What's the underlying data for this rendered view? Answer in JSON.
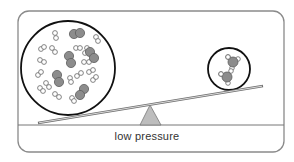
{
  "diagram": {
    "label": "low pressure",
    "colors": {
      "frame": "#8a8a8a",
      "ground": "#777777",
      "beam": "#6f6f6f",
      "fulcrum_fill": "#bdbdbd",
      "fulcrum_stroke": "#777777",
      "container_stroke": "#111111",
      "heavy_atom": "#8c8c8c",
      "light_atom": "#ffffff",
      "atom_stroke": "#666666"
    },
    "frame": {
      "x": 18,
      "y": 11,
      "w": 266,
      "h": 141,
      "r": 11
    },
    "ground": {
      "y": 125
    },
    "beam": {
      "x1": 38,
      "y1": 123,
      "x2": 263,
      "y2": 86
    },
    "fulcrum": {
      "apex": [
        150,
        105
      ],
      "left": [
        140,
        125
      ],
      "right": [
        161,
        125
      ]
    },
    "left_container": {
      "cx": 68,
      "cy": 68,
      "r": 47,
      "description": "many molecules: H2-like pairs of small white atoms and diatomic gray molecules",
      "gray_diatomics": [
        [
          [
            74,
            34
          ],
          [
            80,
            33
          ]
        ],
        [
          [
            69,
            56
          ],
          [
            71,
            63
          ]
        ],
        [
          [
            90,
            52
          ],
          [
            94,
            58
          ]
        ],
        [
          [
            57,
            75
          ],
          [
            59,
            82
          ]
        ],
        [
          [
            84,
            89
          ],
          [
            80,
            95
          ]
        ]
      ],
      "white_pairs": [
        [
          [
            55,
            33
          ],
          [
            56,
            38
          ]
        ],
        [
          [
            96,
            37
          ],
          [
            98,
            41
          ]
        ],
        [
          [
            41,
            49
          ],
          [
            44,
            47
          ]
        ],
        [
          [
            52,
            48
          ],
          [
            55,
            52
          ]
        ],
        [
          [
            76,
            48
          ],
          [
            80,
            48
          ]
        ],
        [
          [
            87,
            48
          ],
          [
            85,
            53
          ]
        ],
        [
          [
            40,
            60
          ],
          [
            44,
            62
          ]
        ],
        [
          [
            84,
            62
          ],
          [
            89,
            62
          ]
        ],
        [
          [
            38,
            75
          ],
          [
            41,
            72
          ]
        ],
        [
          [
            46,
            83
          ],
          [
            49,
            87
          ]
        ],
        [
          [
            70,
            78
          ],
          [
            71,
            82
          ]
        ],
        [
          [
            77,
            76
          ],
          [
            81,
            73
          ]
        ],
        [
          [
            89,
            72
          ],
          [
            93,
            70
          ]
        ],
        [
          [
            93,
            80
          ],
          [
            96,
            77
          ]
        ],
        [
          [
            55,
            94
          ],
          [
            59,
            97
          ]
        ],
        [
          [
            72,
            98
          ],
          [
            74,
            101
          ]
        ],
        [
          [
            40,
            88
          ],
          [
            43,
            91
          ]
        ]
      ]
    },
    "right_container": {
      "cx": 229,
      "cy": 69,
      "r": 21,
      "description": "two NH3-like molecules: gray central atom with three small white atoms",
      "molecules": [
        {
          "center": [
            233,
            62
          ],
          "r": 5,
          "h": [
            [
              228,
              57
            ],
            [
              238,
              59
            ],
            [
              232,
              68
            ]
          ]
        },
        {
          "center": [
            227,
            77
          ],
          "r": 5,
          "h": [
            [
              221,
              74
            ],
            [
              231,
              71
            ],
            [
              228,
              83
            ]
          ]
        }
      ]
    }
  }
}
